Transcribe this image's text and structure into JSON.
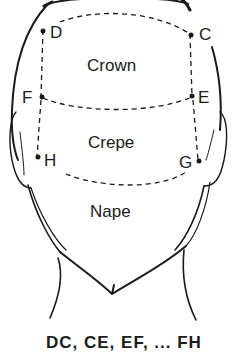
{
  "figure": {
    "zones": [
      {
        "id": "crown",
        "label": "Crown"
      },
      {
        "id": "crepe",
        "label": "Crepe"
      },
      {
        "id": "nape",
        "label": "Nape"
      }
    ],
    "points": {
      "C": "C",
      "D": "D",
      "E": "E",
      "F": "F",
      "G": "G",
      "H": "H"
    },
    "caption": "DC, CE, EF, ... FH",
    "colors": {
      "line": "#1a1a1a",
      "background": "#ffffff"
    }
  }
}
